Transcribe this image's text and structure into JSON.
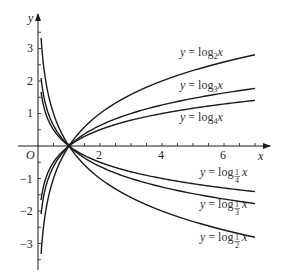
{
  "figure": {
    "type": "function-graph",
    "axes": {
      "x_label": "x",
      "y_label": "y",
      "origin_label": "O",
      "x_ticks": [
        {
          "value": 2,
          "label": "2"
        },
        {
          "value": 4,
          "label": "4"
        },
        {
          "value": 6,
          "label": "6"
        }
      ],
      "y_ticks": [
        {
          "value": 3,
          "label": "3"
        },
        {
          "value": 2,
          "label": "2"
        },
        {
          "value": 1,
          "label": "1"
        },
        {
          "value": -1,
          "label": "−1"
        },
        {
          "value": -2,
          "label": "−2"
        },
        {
          "value": -3,
          "label": "−3"
        }
      ]
    },
    "curves": [
      {
        "id": "log2",
        "label_prefix": "y = log",
        "base": "2",
        "label_suffix": "x"
      },
      {
        "id": "log3",
        "label_prefix": "y = log",
        "base": "3",
        "label_suffix": "x"
      },
      {
        "id": "log4",
        "label_prefix": "y = log",
        "base": "4",
        "label_suffix": "x"
      },
      {
        "id": "log1_4",
        "label_prefix": "y = log",
        "base": "1/4",
        "label_suffix": "x"
      },
      {
        "id": "log1_3",
        "label_prefix": "y = log",
        "base": "1/3",
        "label_suffix": "x"
      },
      {
        "id": "log1_2",
        "label_prefix": "y = log",
        "base": "1/2",
        "label_suffix": "x"
      }
    ],
    "note": "All curves pass through (1, 0)"
  }
}
